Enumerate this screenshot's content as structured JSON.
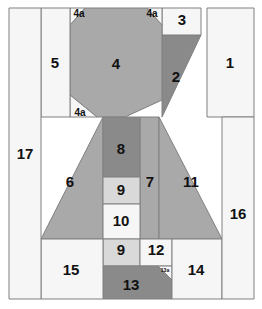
{
  "diagram": {
    "width": 262,
    "height": 309,
    "background_color": "#ffffff",
    "outline_color": "#808080",
    "label_color": "#111111",
    "palette": {
      "white": "#f6f6f6",
      "light_gray": "#d9d9d9",
      "medium_gray": "#a9a9a9",
      "dark_gray": "#8a8a8a"
    },
    "pieces": [
      {
        "id": "p1",
        "label": "1",
        "shape": "rect",
        "fill": "white",
        "points": "207,8 254,8 254,117 207,117",
        "label_x": 230,
        "label_y": 64,
        "size": "lg"
      },
      {
        "id": "p2",
        "label": "2",
        "shape": "polygon",
        "fill": "dark_gray",
        "points": "162,35 201,35 162,117",
        "label_x": 176,
        "label_y": 78,
        "size": "lg"
      },
      {
        "id": "p3",
        "label": "3",
        "shape": "rect",
        "fill": "white",
        "points": "162,8 201,8 201,35 162,35",
        "label_x": 182,
        "label_y": 21,
        "size": "lg"
      },
      {
        "id": "p4",
        "label": "4",
        "shape": "polygon",
        "fill": "medium_gray",
        "points": "70,25 85,8 147,8 162,25 162,100 125,117 97,117 70,95",
        "label_x": 116,
        "label_y": 65,
        "size": "lg"
      },
      {
        "id": "p4a1",
        "label": "4a",
        "shape": "polygon",
        "fill": "white",
        "points": "70,8 85,8 70,25",
        "label_x": 79,
        "label_y": 14,
        "size": "sm"
      },
      {
        "id": "p4a2",
        "label": "4a",
        "shape": "polygon",
        "fill": "white",
        "points": "147,8 162,8 162,25",
        "label_x": 152,
        "label_y": 14,
        "size": "sm"
      },
      {
        "id": "p4a3",
        "label": "4a",
        "shape": "polygon",
        "fill": "white",
        "points": "70,95 97,117 70,117",
        "label_x": 80,
        "label_y": 113,
        "size": "sm"
      },
      {
        "id": "p5",
        "label": "5",
        "shape": "rect",
        "fill": "white",
        "points": "41,8 70,8 70,117 41,117",
        "label_x": 55,
        "label_y": 64,
        "size": "lg"
      },
      {
        "id": "p6",
        "label": "6",
        "shape": "polygon",
        "fill": "medium_gray",
        "points": "103,117 103,239 41,239",
        "label_x": 70,
        "label_y": 183,
        "size": "lg"
      },
      {
        "id": "p7",
        "label": "7",
        "shape": "rect",
        "fill": "medium_gray",
        "points": "140,117 159,117 159,239 140,239",
        "label_x": 150,
        "label_y": 183,
        "size": "lg"
      },
      {
        "id": "p8",
        "label": "8",
        "shape": "rect",
        "fill": "dark_gray",
        "points": "103,117 140,117 140,177 103,177",
        "label_x": 121,
        "label_y": 150,
        "size": "lg"
      },
      {
        "id": "p9",
        "label": "9",
        "shape": "rect",
        "fill": "light_gray",
        "points": "103,177 140,177 140,204 103,204",
        "label_x": 121,
        "label_y": 191,
        "size": "lg"
      },
      {
        "id": "p10",
        "label": "10",
        "shape": "rect",
        "fill": "white",
        "points": "103,204 140,204 140,239 103,239",
        "label_x": 121,
        "label_y": 222,
        "size": "lg"
      },
      {
        "id": "p11",
        "label": "11",
        "shape": "polygon",
        "fill": "medium_gray",
        "points": "159,117 222,239 159,239",
        "label_x": 191,
        "label_y": 183,
        "size": "lg"
      },
      {
        "id": "p9b",
        "label": "9",
        "shape": "rect",
        "fill": "light_gray",
        "points": "103,239 140,239 140,266 103,266",
        "label_x": 121,
        "label_y": 251,
        "size": "lg"
      },
      {
        "id": "p12",
        "label": "12",
        "shape": "rect",
        "fill": "white",
        "points": "140,239 172,239 172,266 140,266",
        "label_x": 156,
        "label_y": 251,
        "size": "lg"
      },
      {
        "id": "p13",
        "label": "13",
        "shape": "polygon",
        "fill": "dark_gray",
        "points": "103,266 158,266 172,280 172,299 103,299",
        "label_x": 131,
        "label_y": 286,
        "size": "lg"
      },
      {
        "id": "p13a",
        "label": "13a",
        "shape": "polygon",
        "fill": "white",
        "points": "158,266 172,266 172,280",
        "label_x": 165,
        "label_y": 271,
        "size": "xs"
      },
      {
        "id": "p14",
        "label": "14",
        "shape": "rect",
        "fill": "white",
        "points": "172,239 222,239 222,299 172,299",
        "label_x": 196,
        "label_y": 271,
        "size": "lg"
      },
      {
        "id": "p15",
        "label": "15",
        "shape": "rect",
        "fill": "white",
        "points": "41,239 103,239 103,299 41,299",
        "label_x": 71,
        "label_y": 271,
        "size": "lg"
      },
      {
        "id": "p16",
        "label": "16",
        "shape": "rect",
        "fill": "white",
        "points": "222,117 254,117 254,299 222,299",
        "label_x": 238,
        "label_y": 215,
        "size": "lg"
      },
      {
        "id": "p17",
        "label": "17",
        "shape": "rect",
        "fill": "white",
        "points": "9,8 41,8 41,299 9,299",
        "label_x": 25,
        "label_y": 155,
        "size": "lg"
      }
    ]
  }
}
